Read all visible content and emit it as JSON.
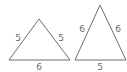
{
  "diagram": {
    "triangles": [
      {
        "name": "triangle-left",
        "sides": {
          "left": "5",
          "right": "5",
          "base": "6"
        }
      },
      {
        "name": "triangle-right",
        "sides": {
          "left": "6",
          "right": "6",
          "base": "5"
        }
      }
    ],
    "colors": {
      "line": "#6e6e6e",
      "text": "#6a6a6a",
      "background": "#ffffff"
    }
  }
}
